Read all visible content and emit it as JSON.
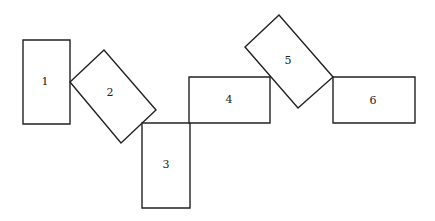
{
  "diagram": {
    "title": "",
    "stroke_color": "#222222",
    "background_color": "#ffffff",
    "shapes": [
      {
        "id": "1",
        "label": "1",
        "points": "23,40 70,40 70,124 23,124",
        "label_x": 45,
        "label_y": 82
      },
      {
        "id": "2",
        "label": "2",
        "points": "70,82 104,50 156,110 121,143",
        "label_x": 110,
        "label_y": 93
      },
      {
        "id": "3",
        "label": "3",
        "points": "142,123 190,123 190,208 142,208",
        "label_x": 166,
        "label_y": 165
      },
      {
        "id": "4",
        "label": "4",
        "points": "189,77 270,77 270,123 189,123",
        "label_x": 229,
        "label_y": 100
      },
      {
        "id": "5",
        "label": "5",
        "points": "245,47 279,15 333,77 298,108",
        "label_x": 288,
        "label_y": 61
      },
      {
        "id": "6",
        "label": "6",
        "points": "333,77 415,77 415,123 333,123",
        "label_x": 373,
        "label_y": 101
      }
    ]
  }
}
